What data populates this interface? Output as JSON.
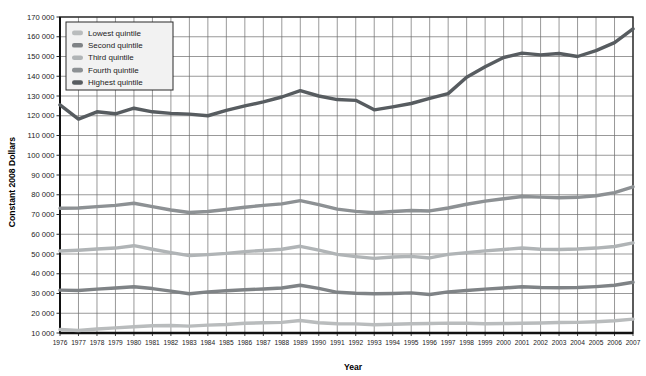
{
  "chart_data": {
    "type": "line",
    "title": "",
    "xlabel": "Year",
    "ylabel": "Constant 2008 Dollars",
    "grid": true,
    "legend_position": "top-left",
    "xlim": [
      1976,
      2007
    ],
    "ylim": [
      10000,
      170000
    ],
    "ytick_step": 10000,
    "yticks": [
      10000,
      20000,
      30000,
      40000,
      50000,
      60000,
      70000,
      80000,
      90000,
      100000,
      110000,
      120000,
      130000,
      140000,
      150000,
      160000,
      170000
    ],
    "ytick_labels": [
      "10 000",
      "20 000",
      "30 000",
      "40 000",
      "50 000",
      "60 000",
      "70 000",
      "80 000",
      "90 000",
      "100 000",
      "110 000",
      "120 000",
      "130 000",
      "140 000",
      "150 000",
      "160 000",
      "170 000"
    ],
    "categories": [
      1976,
      1977,
      1978,
      1979,
      1980,
      1981,
      1982,
      1983,
      1984,
      1985,
      1986,
      1987,
      1988,
      1989,
      1990,
      1991,
      1992,
      1993,
      1994,
      1995,
      1996,
      1997,
      1998,
      1999,
      2000,
      2001,
      2002,
      2003,
      2004,
      2005,
      2006,
      2007
    ],
    "xtick_labels": [
      "1976",
      "1977",
      "1978",
      "1979",
      "1980",
      "1981",
      "1982",
      "1983",
      "1984",
      "1985",
      "1986",
      "1987",
      "1988",
      "1989",
      "1990",
      "1991",
      "1992",
      "1993",
      "1994",
      "1995",
      "1996",
      "1997",
      "1998",
      "1999",
      "2000",
      "2001",
      "2002",
      "2003",
      "2004",
      "2005",
      "2006",
      "2007"
    ],
    "series": [
      {
        "name": "Lowest quintile",
        "color": "#b9bcbd",
        "values": [
          11800,
          11300,
          12000,
          12600,
          13200,
          13700,
          13800,
          13500,
          14000,
          14300,
          14900,
          15200,
          15400,
          16300,
          15200,
          14700,
          14600,
          14200,
          14400,
          14700,
          14800,
          15000,
          14900,
          14700,
          14800,
          14900,
          15100,
          15300,
          15400,
          15700,
          16200,
          17000
        ]
      },
      {
        "name": "Second quintile",
        "color": "#7f8386",
        "values": [
          31700,
          31500,
          32200,
          32800,
          33400,
          32500,
          31200,
          29900,
          30800,
          31400,
          31900,
          32300,
          32800,
          34200,
          32600,
          30600,
          30100,
          29900,
          30000,
          30300,
          29500,
          30800,
          31500,
          32200,
          32800,
          33400,
          33000,
          32900,
          33000,
          33500,
          34200,
          35700
        ]
      },
      {
        "name": "Third quintile",
        "color": "#b0b4b6",
        "values": [
          51500,
          51900,
          52500,
          53000,
          54200,
          52400,
          50700,
          49200,
          49700,
          50300,
          51200,
          51800,
          52400,
          53900,
          52000,
          49800,
          48700,
          47800,
          48500,
          48800,
          48000,
          49800,
          50700,
          51600,
          52300,
          53000,
          52400,
          52300,
          52500,
          53000,
          53800,
          55600
        ]
      },
      {
        "name": "Fourth quintile",
        "color": "#8d9194",
        "values": [
          73200,
          73300,
          74000,
          74600,
          75700,
          74000,
          72300,
          71000,
          71500,
          72500,
          73700,
          74600,
          75400,
          77000,
          75000,
          72700,
          71600,
          70900,
          71500,
          72000,
          71800,
          73300,
          75200,
          76800,
          78000,
          79100,
          78800,
          78500,
          78700,
          79500,
          81100,
          84000
        ]
      },
      {
        "name": "Highest quintile",
        "color": "#575c60",
        "values": [
          125500,
          118300,
          122000,
          121000,
          123800,
          122000,
          121200,
          120800,
          120000,
          122700,
          125000,
          127000,
          129500,
          132700,
          130000,
          128200,
          127800,
          123000,
          124500,
          126200,
          128800,
          131200,
          139500,
          144800,
          149500,
          151700,
          150800,
          151500,
          150000,
          153000,
          157000,
          164000
        ]
      }
    ]
  },
  "legend": {
    "items": [
      {
        "label": "Lowest quintile"
      },
      {
        "label": "Second quintile"
      },
      {
        "label": "Third quintile"
      },
      {
        "label": "Fourth quintile"
      },
      {
        "label": "Highest quintile"
      }
    ]
  }
}
